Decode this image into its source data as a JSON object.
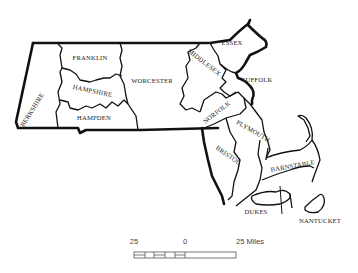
{
  "map": {
    "title": "Massachusetts Counties",
    "counties": [
      {
        "name": "BERKSHIRE"
      },
      {
        "name": "FRANKLIN"
      },
      {
        "name": "HAMPSHIRE"
      },
      {
        "name": "HAMPDEN"
      },
      {
        "name": "WORCESTER"
      },
      {
        "name": "MIDDLESEX"
      },
      {
        "name": "ESSEX"
      },
      {
        "name": "SUFFOLK"
      },
      {
        "name": "NORFOLK"
      },
      {
        "name": "PLYMOUTH"
      },
      {
        "name": "BRISTOL"
      },
      {
        "name": "BARNSTABLE"
      },
      {
        "name": "DUKES"
      },
      {
        "name": "NANTUCKET"
      }
    ],
    "scale": {
      "left_label": "25",
      "mid_label": "0",
      "right_label": "25 Miles"
    },
    "colors": {
      "outline": "#111111",
      "background": "#ffffff"
    }
  }
}
